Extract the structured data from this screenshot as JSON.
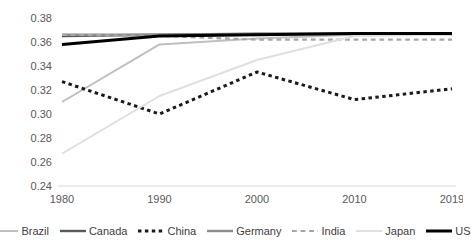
{
  "chart_data": {
    "type": "line",
    "title": "",
    "xlabel": "",
    "ylabel": "",
    "categories": [
      "1980",
      "1990",
      "2000",
      "2010",
      "2019"
    ],
    "x_tick_labels": [
      "1980",
      "1990",
      "2000",
      "2010",
      "2019"
    ],
    "y_tick_labels": [
      "0.24",
      "0.26",
      "0.28",
      "0.30",
      "0.32",
      "0.34",
      "0.36",
      "0.38"
    ],
    "y_tick_values": [
      0.24,
      0.26,
      0.28,
      0.3,
      0.32,
      0.34,
      0.36,
      0.38
    ],
    "ylim": [
      0.24,
      0.38
    ],
    "grid": false,
    "legend_position": "bottom",
    "series": [
      {
        "name": "Brazil",
        "values": [
          0.31,
          0.358,
          0.363,
          0.366,
          0.366
        ],
        "color": "#bfbfbf",
        "dash": "none",
        "width": 2
      },
      {
        "name": "Canada",
        "values": [
          0.365,
          0.366,
          0.367,
          0.367,
          0.367
        ],
        "color": "#595959",
        "dash": "none",
        "width": 2.4
      },
      {
        "name": "China",
        "values": [
          0.327,
          0.3,
          0.335,
          0.312,
          0.321
        ],
        "color": "#1a1a1a",
        "dash": "dotted",
        "width": 3
      },
      {
        "name": "Germany",
        "values": [
          0.366,
          0.366,
          0.366,
          0.367,
          0.367
        ],
        "color": "#8c8c8c",
        "dash": "none",
        "width": 2.4
      },
      {
        "name": "India",
        "values": [
          0.366,
          0.365,
          0.362,
          0.362,
          0.362
        ],
        "color": "#a6a6a6",
        "dash": "dashed",
        "width": 2.2
      },
      {
        "name": "Japan",
        "values": [
          0.267,
          0.315,
          0.345,
          0.365,
          0.366
        ],
        "color": "#e0e0e0",
        "dash": "none",
        "width": 2
      },
      {
        "name": "US",
        "values": [
          0.358,
          0.365,
          0.366,
          0.367,
          0.367
        ],
        "color": "#000000",
        "dash": "none",
        "width": 3
      }
    ]
  },
  "legend": {
    "items": [
      {
        "label": "Brazil"
      },
      {
        "label": "Canada"
      },
      {
        "label": "China"
      },
      {
        "label": "Germany"
      },
      {
        "label": "India"
      },
      {
        "label": "Japan"
      },
      {
        "label": "US"
      }
    ]
  },
  "axis": {
    "baseline_color": "#d9d9d9"
  }
}
